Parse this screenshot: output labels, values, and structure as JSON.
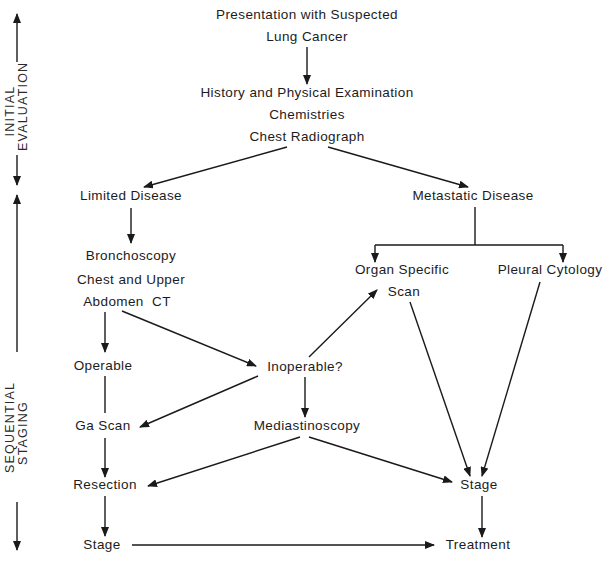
{
  "diagram": {
    "type": "flowchart",
    "side_labels": {
      "initial_evaluation": [
        "INITIAL",
        "EVALUATION"
      ],
      "sequential_staging": [
        "SEQUENTIAL",
        "STAGING"
      ]
    },
    "nodes": {
      "presentation_1": "Presentation with Suspected",
      "presentation_2": "Lung Cancer",
      "history": "History and Physical Examination",
      "chemistries": "Chemistries",
      "chest_radiograph": "Chest Radiograph",
      "limited_disease": "Limited Disease",
      "metastatic_disease": "Metastatic Disease",
      "bronchoscopy": "Bronchoscopy",
      "chest_upper_1": "Chest and Upper",
      "chest_upper_2": "Abdomen  CT",
      "organ_specific_1": "Organ Specific",
      "organ_specific_2": "Scan",
      "pleural_cytology": "Pleural Cytology",
      "operable": "Operable",
      "inoperable": "Inoperable?",
      "ga_scan": "Ga Scan",
      "mediastinoscopy": "Mediastinoscopy",
      "resection": "Resection",
      "stage_right": "Stage",
      "stage_left": "Stage",
      "treatment": "Treatment"
    },
    "edges": [
      {
        "from": "Presentation with Suspected Lung Cancer",
        "to": "History and Physical Examination / Chemistries / Chest Radiograph",
        "arrow": true
      },
      {
        "from": "Chest Radiograph",
        "to": "Limited Disease",
        "arrow": true
      },
      {
        "from": "Chest Radiograph",
        "to": "Metastatic Disease",
        "arrow": true
      },
      {
        "from": "Limited Disease",
        "to": "Bronchoscopy",
        "arrow": true
      },
      {
        "from": "Metastatic Disease",
        "to": "Organ Specific Scan",
        "arrow": true
      },
      {
        "from": "Metastatic Disease",
        "to": "Pleural Cytology",
        "arrow": true
      },
      {
        "from": "Abdomen CT",
        "to": "Operable",
        "arrow": true
      },
      {
        "from": "Abdomen CT",
        "to": "Inoperable?",
        "arrow": true
      },
      {
        "from": "Inoperable?",
        "to": "Organ Specific Scan",
        "arrow": true
      },
      {
        "from": "Inoperable?",
        "to": "Ga Scan",
        "arrow": true
      },
      {
        "from": "Inoperable?",
        "to": "Mediastinoscopy",
        "arrow": true
      },
      {
        "from": "Operable",
        "to": "Ga Scan",
        "arrow": false
      },
      {
        "from": "Ga Scan",
        "to": "Resection",
        "arrow": true
      },
      {
        "from": "Mediastinoscopy",
        "to": "Resection",
        "arrow": true
      },
      {
        "from": "Mediastinoscopy",
        "to": "Stage (right)",
        "arrow": true
      },
      {
        "from": "Organ Specific Scan",
        "to": "Stage (right)",
        "arrow": true
      },
      {
        "from": "Pleural Cytology",
        "to": "Stage (right)",
        "arrow": true
      },
      {
        "from": "Resection",
        "to": "Stage (left)",
        "arrow": true
      },
      {
        "from": "Stage (right)",
        "to": "Treatment",
        "arrow": true
      },
      {
        "from": "Stage (left)",
        "to": "Treatment",
        "arrow": true
      }
    ],
    "colors": {
      "ink": "#1a1a1a",
      "background": "#ffffff"
    }
  }
}
